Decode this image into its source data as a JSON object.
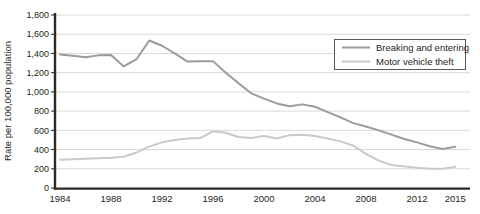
{
  "chart_data": {
    "type": "line",
    "title": "",
    "xlabel": "",
    "ylabel": "Rate per 100,000 population",
    "ylim": [
      0,
      1800
    ],
    "ytick_step": 200,
    "ytick_labels": [
      "0",
      "200",
      "400",
      "600",
      "800",
      "1,000",
      "1,200",
      "1,400",
      "1,600",
      "1,800"
    ],
    "xtick_years": [
      1984,
      1988,
      1992,
      1996,
      2000,
      2004,
      2008,
      2012,
      2015
    ],
    "xtick_labels": [
      "1984",
      "1988",
      "1992",
      "1996",
      "2000",
      "2004",
      "2008",
      "2012",
      "2015"
    ],
    "grid": "horizontal",
    "legend_position": "top-right",
    "x": [
      1984,
      1985,
      1986,
      1987,
      1988,
      1989,
      1990,
      1991,
      1992,
      1993,
      1994,
      1995,
      1996,
      1997,
      1998,
      1999,
      2000,
      2001,
      2002,
      2003,
      2004,
      2005,
      2006,
      2007,
      2008,
      2009,
      2010,
      2011,
      2012,
      2013,
      2014,
      2015
    ],
    "series": [
      {
        "name": "Breaking and entering",
        "color": "#9b9b9b",
        "values": [
          1390,
          1375,
          1360,
          1380,
          1385,
          1265,
          1340,
          1535,
          1480,
          1400,
          1315,
          1320,
          1320,
          1200,
          1090,
          985,
          930,
          880,
          850,
          870,
          845,
          790,
          735,
          675,
          640,
          600,
          555,
          510,
          475,
          435,
          405,
          430
        ]
      },
      {
        "name": "Motor vehicle theft",
        "color": "#c9c9c9",
        "values": [
          295,
          300,
          305,
          310,
          315,
          325,
          370,
          430,
          475,
          500,
          515,
          520,
          590,
          575,
          530,
          520,
          540,
          515,
          550,
          555,
          540,
          515,
          485,
          440,
          355,
          285,
          240,
          225,
          210,
          200,
          200,
          220
        ]
      }
    ]
  },
  "colors": {
    "grid": "#d9d9d9",
    "axis": "#2b2a29",
    "text": "#231f20",
    "legend_border": "#58595b",
    "background": "#ffffff"
  }
}
